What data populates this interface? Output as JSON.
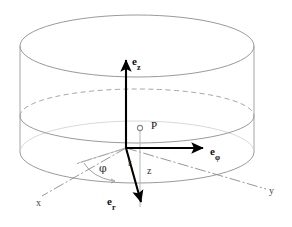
{
  "figure": {
    "colors": {
      "background": "#ffffff",
      "cylinder_outline": "#888888",
      "hidden_edge": "#999999",
      "axis_line": "#8a8a8a",
      "vector": "#000000",
      "drop_line": "#aaaaaa",
      "label": "#111111"
    },
    "canvas": {
      "width": 292,
      "height": 227
    }
  },
  "labels": {
    "e_vector_base": "e",
    "e_z_sub": "z",
    "e_phi_sub": "φ",
    "e_r_sub": "r",
    "point": "P",
    "radius": "r",
    "height": "z",
    "angle": "φ",
    "axis_x": "x",
    "axis_y": "y"
  },
  "geometry": {
    "origin": {
      "x": 126,
      "y": 148
    },
    "point_P": {
      "x": 140,
      "y": 128
    },
    "top_ellipse": {
      "cx": 137,
      "cy": 46,
      "rx": 118,
      "ry": 30
    },
    "bottom_ellipse": {
      "cx": 137,
      "cy": 152,
      "rx": 118,
      "ry": 30
    },
    "mid_ellipse": {
      "cx": 137,
      "cy": 116,
      "rx": 118,
      "ry": 26
    },
    "e_z_tip": {
      "x": 126,
      "y": 56
    },
    "e_phi_tip": {
      "x": 206,
      "y": 148
    },
    "e_r_tip": {
      "x": 142,
      "y": 206
    },
    "x_axis_end": {
      "x": 44,
      "y": 196
    },
    "y_axis_end": {
      "x": 266,
      "y": 188
    },
    "radial_line_end": {
      "x": 78,
      "y": 164
    }
  }
}
